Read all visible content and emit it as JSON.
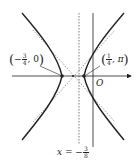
{
  "figure": {
    "type": "hyperbola-diagram",
    "colors": {
      "stroke": "#222222",
      "dashed": "#555555",
      "background": "#ffffff"
    },
    "axes": {
      "origin_label": "O"
    },
    "points": [
      {
        "label_open": "(",
        "sign": "−",
        "num": "3",
        "den": "4",
        "rest": ", 0",
        "label_close": ")",
        "role": "left-vertex"
      },
      {
        "label_open": "(",
        "sign": "",
        "num": "1",
        "den": "4",
        "rest": ", π",
        "label_close": ")",
        "role": "right-vertex"
      }
    ],
    "directrix": {
      "prefix": "x = −",
      "num": "3",
      "den": "8"
    }
  }
}
